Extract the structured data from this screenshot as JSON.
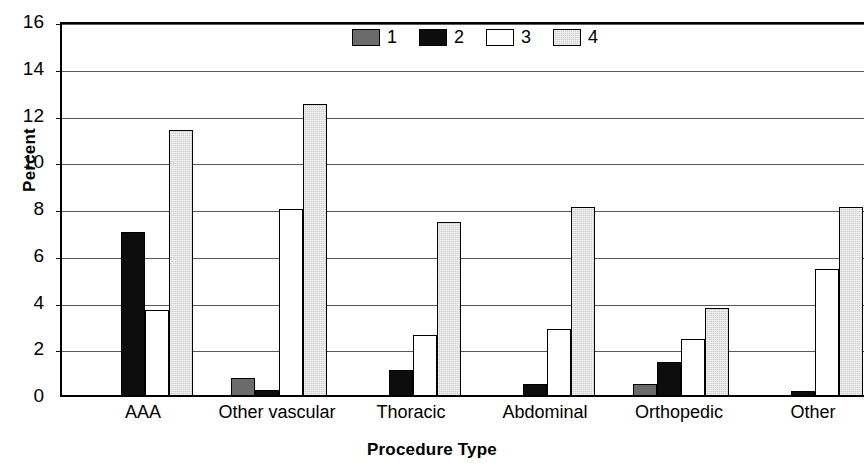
{
  "chart_data": {
    "type": "bar",
    "title": "",
    "subtitle": "",
    "xlabel": "Procedure Type",
    "ylabel": "Percent",
    "ylim": [
      0,
      16
    ],
    "ytick_step": 2,
    "yticks": [
      16,
      14,
      12,
      10,
      8,
      6,
      4,
      2,
      0
    ],
    "grid": true,
    "legend_position": "top-center",
    "categories": [
      "AAA",
      "Other vascular",
      "Thoracic",
      "Abdominal",
      "Orthopedic",
      "Other"
    ],
    "series": [
      {
        "name": "1",
        "color": "#6b6b6b",
        "values": [
          0,
          0.75,
          0,
          0,
          0.5,
          0
        ]
      },
      {
        "name": "2",
        "color": "#0d0d0d",
        "values": [
          7.0,
          0.25,
          1.1,
          0.5,
          1.45,
          0.2
        ]
      },
      {
        "name": "3",
        "color": "#ffffff",
        "values": [
          3.7,
          8.0,
          2.6,
          2.85,
          2.45,
          5.45
        ]
      },
      {
        "name": "4",
        "color": "#cfcfcf",
        "values": [
          11.4,
          12.5,
          7.45,
          8.1,
          3.75,
          8.1
        ]
      }
    ]
  },
  "legend": {
    "items": [
      {
        "label": "1",
        "swatch": "legend-swatch-series-1"
      },
      {
        "label": "2",
        "swatch": "legend-swatch-series-2"
      },
      {
        "label": "3",
        "swatch": "legend-swatch-series-3"
      },
      {
        "label": "4",
        "swatch": "legend-swatch-series-4"
      }
    ]
  }
}
